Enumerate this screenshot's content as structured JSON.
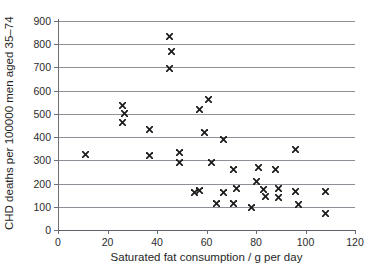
{
  "chart_data": {
    "type": "scatter",
    "title": "",
    "xlabel": "Saturated fat consumption / g per day",
    "ylabel": "CHD deaths per 100000 men aged 35–74",
    "xlim": [
      0,
      120
    ],
    "ylim": [
      0,
      900
    ],
    "xticks": [
      0,
      20,
      40,
      60,
      80,
      100,
      120
    ],
    "yticks": [
      0,
      100,
      200,
      300,
      400,
      500,
      600,
      700,
      800,
      900
    ],
    "xtick_labels": [
      "0",
      "20",
      "40",
      "60",
      "80",
      "100",
      "120"
    ],
    "ytick_labels": [
      "0",
      "100",
      "200",
      "300",
      "400",
      "500",
      "600",
      "700",
      "800",
      "900"
    ],
    "grid": "horizontal",
    "legend": null,
    "marker": "x-cross",
    "marker_color": "#1b1b1b",
    "points": [
      {
        "x": 11,
        "y": 325
      },
      {
        "x": 26,
        "y": 537
      },
      {
        "x": 26,
        "y": 462
      },
      {
        "x": 27,
        "y": 500
      },
      {
        "x": 37,
        "y": 432
      },
      {
        "x": 37,
        "y": 320
      },
      {
        "x": 45,
        "y": 832
      },
      {
        "x": 45,
        "y": 695
      },
      {
        "x": 46,
        "y": 767
      },
      {
        "x": 49,
        "y": 332
      },
      {
        "x": 49,
        "y": 290
      },
      {
        "x": 55,
        "y": 160
      },
      {
        "x": 57,
        "y": 518
      },
      {
        "x": 57,
        "y": 170
      },
      {
        "x": 59,
        "y": 420
      },
      {
        "x": 61,
        "y": 560
      },
      {
        "x": 62,
        "y": 290
      },
      {
        "x": 64,
        "y": 113
      },
      {
        "x": 67,
        "y": 390
      },
      {
        "x": 67,
        "y": 160
      },
      {
        "x": 71,
        "y": 262
      },
      {
        "x": 71,
        "y": 113
      },
      {
        "x": 72,
        "y": 178
      },
      {
        "x": 78,
        "y": 95
      },
      {
        "x": 80,
        "y": 207
      },
      {
        "x": 81,
        "y": 270
      },
      {
        "x": 83,
        "y": 175
      },
      {
        "x": 84,
        "y": 145
      },
      {
        "x": 88,
        "y": 262
      },
      {
        "x": 89,
        "y": 177
      },
      {
        "x": 89,
        "y": 140
      },
      {
        "x": 96,
        "y": 345
      },
      {
        "x": 96,
        "y": 167
      },
      {
        "x": 97,
        "y": 110
      },
      {
        "x": 108,
        "y": 167
      },
      {
        "x": 108,
        "y": 70
      }
    ]
  }
}
